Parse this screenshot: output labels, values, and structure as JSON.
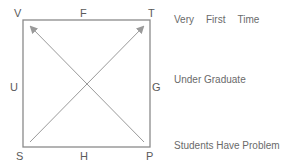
{
  "diagram": {
    "corners": {
      "top_left": "V",
      "top_right": "T",
      "bottom_left": "S",
      "bottom_right": "P"
    },
    "midpoints": {
      "top": "F",
      "bottom": "H",
      "left": "U",
      "right": "G"
    },
    "arrows": [
      {
        "from": "S",
        "to": "T"
      },
      {
        "from": "P",
        "to": "V"
      }
    ],
    "colors": {
      "box": "#8a8a8a",
      "arrow": "#9a9a9a",
      "text": "#6a6a6a"
    }
  },
  "legend": {
    "line1": [
      "Very",
      "First",
      "Time"
    ],
    "line2": "Under Graduate",
    "line3": "Students Have Problem"
  }
}
